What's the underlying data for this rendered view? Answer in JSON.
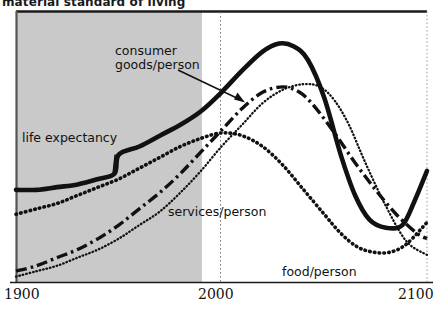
{
  "title": "material standard of living",
  "axis": {
    "x_ticks": [
      "1900",
      "2000",
      "2100"
    ]
  },
  "labels": {
    "consumer": "consumer\ngoods/person",
    "consumer_line1": "consumer",
    "consumer_line2": "goods/person",
    "life": "life expectancy",
    "services": "services/person",
    "food": "food/person"
  },
  "colors": {
    "ink": "#111111",
    "shade": "#c9c9c9",
    "frame": "#1a1a1a"
  },
  "chart_data": {
    "type": "line",
    "title": "material standard of living",
    "subtitle": "",
    "xlabel": "",
    "ylabel": "material standard of living",
    "xlim": [
      1900,
      2100
    ],
    "ylim": [
      0,
      100
    ],
    "x_ticks": [
      1900,
      2000,
      2100
    ],
    "y_ticks": [],
    "grid": false,
    "legend": "in-plot annotations",
    "annotations": [
      {
        "text": "consumer goods/person",
        "x": 1950,
        "y": 84,
        "arrow_to": {
          "x": 2012,
          "y": 66
        }
      },
      {
        "text": "life expectancy",
        "x": 1905,
        "y": 55
      },
      {
        "text": "services/person",
        "x": 1975,
        "y": 28
      },
      {
        "text": "food/person",
        "x": 2030,
        "y": 7
      }
    ],
    "shaded_region": {
      "x_start": 1900,
      "x_end": 1990,
      "label": "historical"
    },
    "marker_line_x": 2000,
    "series": [
      {
        "name": "life expectancy",
        "style": "solid-thick",
        "x": [
          1900,
          1910,
          1920,
          1930,
          1940,
          1948,
          1950,
          1960,
          1970,
          1980,
          1990,
          2000,
          2010,
          2020,
          2028,
          2035,
          2042,
          2050,
          2058,
          2065,
          2072,
          2080,
          2088,
          2094,
          2100
        ],
        "values": [
          34,
          34,
          35,
          36,
          38,
          40,
          47,
          50,
          54,
          58,
          63,
          70,
          78,
          85,
          88,
          87,
          82,
          68,
          47,
          32,
          23,
          20,
          21,
          30,
          41
        ]
      },
      {
        "name": "consumer goods/person",
        "style": "dash-dot",
        "x": [
          1900,
          1910,
          1920,
          1930,
          1940,
          1950,
          1960,
          1970,
          1980,
          1990,
          2000,
          2010,
          2020,
          2030,
          2038,
          2045,
          2055,
          2065,
          2075,
          2085,
          2095,
          2100
        ],
        "values": [
          4,
          6,
          9,
          12,
          16,
          21,
          27,
          33,
          40,
          48,
          56,
          64,
          70,
          72,
          70,
          65,
          55,
          44,
          34,
          25,
          18,
          16
        ]
      },
      {
        "name": "services/person",
        "style": "dotted-fine",
        "x": [
          1900,
          1910,
          1920,
          1930,
          1940,
          1950,
          1960,
          1970,
          1980,
          1990,
          2000,
          2010,
          2020,
          2030,
          2040,
          2048,
          2055,
          2062,
          2070,
          2080,
          2090,
          2100
        ],
        "values": [
          2,
          4,
          6,
          9,
          12,
          16,
          21,
          26,
          33,
          41,
          50,
          58,
          66,
          71,
          73,
          72,
          67,
          58,
          44,
          28,
          15,
          10
        ]
      },
      {
        "name": "food/person",
        "style": "dotted-bold",
        "x": [
          1900,
          1910,
          1920,
          1930,
          1940,
          1950,
          1960,
          1970,
          1980,
          1990,
          2000,
          2010,
          2020,
          2030,
          2040,
          2050,
          2058,
          2066,
          2074,
          2082,
          2090,
          2100
        ],
        "values": [
          25,
          27,
          29,
          32,
          35,
          38,
          42,
          46,
          50,
          53,
          55,
          54,
          50,
          43,
          34,
          25,
          18,
          13,
          11,
          11,
          14,
          22
        ]
      }
    ]
  }
}
